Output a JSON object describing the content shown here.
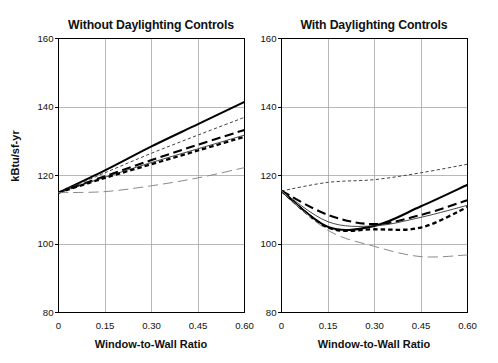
{
  "figure": {
    "cropped_header_text": "",
    "y_axis_label": "kBtu/sf-yr",
    "x_axis_label": "Window-to-Wall Ratio",
    "y_ticks": [
      "80",
      "100",
      "120",
      "140",
      "160"
    ],
    "x_ticks": [
      "0",
      "0.15",
      "0.30",
      "0.45",
      "0.60"
    ],
    "panels": [
      {
        "id": "left",
        "title": "Without Daylighting Controls"
      },
      {
        "id": "right",
        "title": "With Daylighting Controls"
      }
    ]
  },
  "chart_data": [
    {
      "type": "line",
      "title": "Without Daylighting Controls",
      "xlabel": "Window-to-Wall Ratio",
      "ylabel": "kBtu/sf-yr",
      "xlim": [
        0,
        0.6
      ],
      "ylim": [
        80,
        160
      ],
      "xticks": [
        0,
        0.15,
        0.3,
        0.45,
        0.6
      ],
      "yticks": [
        80,
        100,
        120,
        140,
        160
      ],
      "grid": true,
      "legend": "none",
      "x": [
        0,
        0.15,
        0.3,
        0.45,
        0.6
      ],
      "series": [
        {
          "name": "series-1-thick-solid",
          "style": "solid-thick",
          "color": "#000000",
          "values": [
            115.0,
            121.5,
            128.5,
            135.0,
            141.5
          ]
        },
        {
          "name": "series-2-thin-fine-dash",
          "style": "fine-dash-thin",
          "color": "#444444",
          "values": [
            115.0,
            120.8,
            126.5,
            131.8,
            137.0
          ]
        },
        {
          "name": "series-3-thick-long-dash",
          "style": "long-dash-thick",
          "color": "#000000",
          "values": [
            115.0,
            119.8,
            124.5,
            129.0,
            133.3
          ]
        },
        {
          "name": "series-4-thin-solid",
          "style": "solid-thin",
          "color": "#333333",
          "values": [
            115.0,
            119.5,
            123.8,
            127.8,
            131.8
          ]
        },
        {
          "name": "series-5-thick-short-dash",
          "style": "short-dash-thick",
          "color": "#000000",
          "values": [
            115.0,
            119.3,
            123.3,
            127.3,
            131.3
          ]
        },
        {
          "name": "series-6-gray-long-dash",
          "style": "long-dash-gray",
          "color": "#8a8a8a",
          "values": [
            115.0,
            115.3,
            117.0,
            119.3,
            122.3
          ]
        }
      ]
    },
    {
      "type": "line",
      "title": "With Daylighting Controls",
      "xlabel": "Window-to-Wall Ratio",
      "ylabel": "kBtu/sf-yr",
      "xlim": [
        0,
        0.6
      ],
      "ylim": [
        80,
        160
      ],
      "xticks": [
        0,
        0.15,
        0.3,
        0.45,
        0.6
      ],
      "yticks": [
        80,
        100,
        120,
        140,
        160
      ],
      "grid": true,
      "legend": "none",
      "x": [
        0,
        0.15,
        0.3,
        0.45,
        0.6
      ],
      "series": [
        {
          "name": "series-1-thick-solid",
          "style": "solid-thick",
          "color": "#000000",
          "values": [
            115.5,
            105.0,
            105.3,
            111.0,
            117.3
          ]
        },
        {
          "name": "series-2-thin-fine-dash",
          "style": "fine-dash-thin",
          "color": "#444444",
          "values": [
            115.5,
            118.0,
            118.8,
            120.8,
            123.3
          ]
        },
        {
          "name": "series-3-thick-long-dash",
          "style": "long-dash-thick",
          "color": "#000000",
          "values": [
            115.5,
            108.5,
            105.8,
            108.5,
            112.8
          ]
        },
        {
          "name": "series-4-thin-solid",
          "style": "solid-thin",
          "color": "#333333",
          "values": [
            115.5,
            106.5,
            105.3,
            107.8,
            111.3
          ]
        },
        {
          "name": "series-5-thick-short-dash",
          "style": "short-dash-thick",
          "color": "#000000",
          "values": [
            115.5,
            104.8,
            104.3,
            104.8,
            110.8
          ]
        },
        {
          "name": "series-6-gray-long-dash",
          "style": "long-dash-gray",
          "color": "#8a8a8a",
          "values": [
            115.5,
            104.0,
            99.3,
            96.3,
            96.8
          ]
        }
      ]
    }
  ]
}
